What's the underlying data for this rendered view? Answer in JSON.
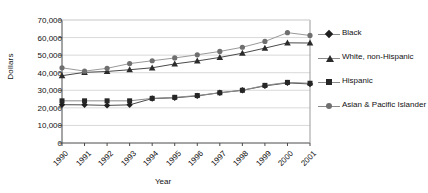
{
  "chart_data": {
    "type": "line",
    "title": "",
    "xlabel": "Year",
    "ylabel": "Dollars",
    "categories": [
      "1990",
      "1991",
      "1992",
      "1993",
      "1994",
      "1995",
      "1996",
      "1997",
      "1998",
      "1999",
      "2000",
      "2001"
    ],
    "ylim": [
      0,
      70000
    ],
    "ytick_values": [
      0,
      10000,
      20000,
      30000,
      40000,
      50000,
      60000,
      70000
    ],
    "ytick_labels": [
      "0",
      "10,000",
      "20,000",
      "30,000",
      "40,000",
      "50,000",
      "60,000",
      "70,000"
    ],
    "grid": "horizontal",
    "legend_position": "right",
    "series": [
      {
        "name": "Black",
        "marker": "diamond",
        "color": "#1f1f1f",
        "values": [
          21800,
          21700,
          21400,
          21700,
          25300,
          25700,
          26800,
          28600,
          30000,
          32500,
          34200,
          33600
        ]
      },
      {
        "name": "White, non-Hispanic",
        "marker": "triangle",
        "color": "#2b2b2b",
        "values": [
          38300,
          40200,
          40700,
          41700,
          42800,
          45000,
          46700,
          48700,
          51100,
          54000,
          57000,
          56900
        ]
      },
      {
        "name": "Hispanic",
        "marker": "square",
        "color": "#262626",
        "values": [
          24000,
          24000,
          24000,
          24000,
          25400,
          26000,
          27000,
          28600,
          30000,
          32800,
          34500,
          34000
        ]
      },
      {
        "name": "Asian & Pacific Islander",
        "marker": "circle",
        "color": "#6f6f6f",
        "values": [
          42800,
          40900,
          42500,
          45200,
          46800,
          48400,
          50200,
          52100,
          54500,
          57800,
          62800,
          61200
        ]
      }
    ]
  },
  "legend": {
    "items": [
      {
        "label": "Black",
        "marker": "diamond"
      },
      {
        "label": "White, non-Hispanic",
        "marker": "triangle"
      },
      {
        "label": "Hispanic",
        "marker": "square"
      },
      {
        "label": "Asian & Pacific Islander",
        "marker": "circle"
      }
    ]
  },
  "axes": {
    "x_title": "Year",
    "y_title": "Dollars"
  }
}
